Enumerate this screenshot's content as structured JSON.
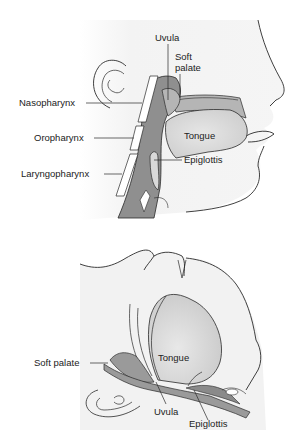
{
  "colors": {
    "background": "#ffffff",
    "skin_shade": "#f0f0f0",
    "pharynx_fill": "#8f8f8f",
    "soft_tissue_fill": "#b5b5b5",
    "tongue_fill": "#e2e2e2",
    "outline": "#2a2a2a",
    "label_text": "#222222"
  },
  "top_panel": {
    "title": "Upright head sagittal view",
    "labels": {
      "uvula": "Uvula",
      "soft_palate_line1": "Soft",
      "soft_palate_line2": "palate",
      "nasopharynx": "Nasopharynx",
      "oropharynx": "Oropharynx",
      "laryngopharynx": "Laryngopharynx",
      "tongue": "Tongue",
      "epiglottis": "Epiglottis"
    }
  },
  "bottom_panel": {
    "title": "Supine head sagittal view",
    "labels": {
      "soft_palate": "Soft palate",
      "tongue": "Tongue",
      "uvula": "Uvula",
      "epiglottis": "Epiglottis"
    }
  }
}
